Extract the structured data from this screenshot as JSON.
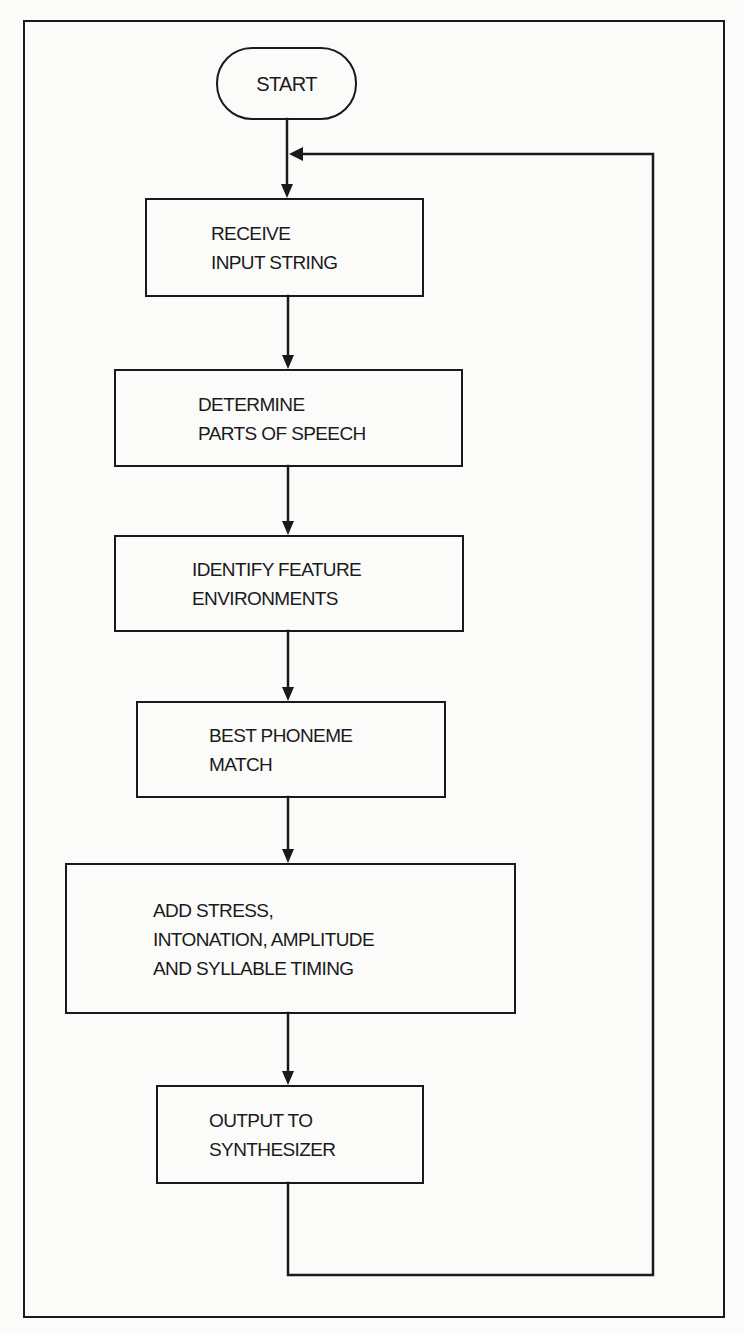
{
  "diagram": {
    "type": "flowchart",
    "start": {
      "label": "START"
    },
    "steps": [
      {
        "id": "receive",
        "label": "RECEIVE\nINPUT STRING"
      },
      {
        "id": "determine",
        "label": "DETERMINE\nPARTS OF SPEECH"
      },
      {
        "id": "identify",
        "label": "IDENTIFY FEATURE\nENVIRONMENTS"
      },
      {
        "id": "best",
        "label": "BEST PHONEME\nMATCH"
      },
      {
        "id": "add",
        "label": "ADD STRESS,\nINTONATION, AMPLITUDE\nAND SYLLABLE TIMING"
      },
      {
        "id": "output",
        "label": "OUTPUT TO\nSYNTHESIZER"
      }
    ],
    "edges": [
      {
        "from": "START",
        "to": "RECEIVE INPUT STRING"
      },
      {
        "from": "RECEIVE INPUT STRING",
        "to": "DETERMINE PARTS OF SPEECH"
      },
      {
        "from": "DETERMINE PARTS OF SPEECH",
        "to": "IDENTIFY FEATURE ENVIRONMENTS"
      },
      {
        "from": "IDENTIFY FEATURE ENVIRONMENTS",
        "to": "BEST PHONEME MATCH"
      },
      {
        "from": "BEST PHONEME MATCH",
        "to": "ADD STRESS, INTONATION, AMPLITUDE AND SYLLABLE TIMING"
      },
      {
        "from": "ADD STRESS, INTONATION, AMPLITUDE AND SYLLABLE TIMING",
        "to": "OUTPUT TO SYNTHESIZER"
      },
      {
        "from": "OUTPUT TO SYNTHESIZER",
        "to": "RECEIVE INPUT STRING",
        "kind": "loop-back"
      }
    ],
    "colors": {
      "ink": "#1a1a1a",
      "paper": "#fbfbfa"
    }
  }
}
